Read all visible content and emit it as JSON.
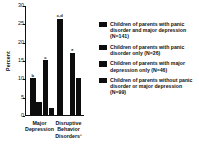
{
  "chart_data": {
    "type": "bar",
    "title": "",
    "xlabel": "",
    "ylabel": "Percent",
    "ylim": [
      0,
      30
    ],
    "yticks": [
      0,
      5,
      10,
      15,
      20,
      25,
      30
    ],
    "ytick_labels": [
      "0",
      "5",
      "10",
      "15",
      "20",
      "25",
      "30"
    ],
    "grid": false,
    "legend_position": "right",
    "categories": [
      "Major Depression",
      "Disruptive Behavior Disorders¹"
    ],
    "series": [
      {
        "name": "Children of parents with panic disorder and major depression (N=141)",
        "values": [
          10.0,
          26.5
        ],
        "annotations": [
          "b",
          "c,d"
        ]
      },
      {
        "name": "Children of parents with panic disorder only (N=26)",
        "values": [
          3.5,
          0.0
        ],
        "annotations": [
          "",
          ""
        ]
      },
      {
        "name": "Children of parents with major depression only (N=46)",
        "values": [
          15.0,
          17.0
        ],
        "annotations": [
          "c",
          "e"
        ]
      },
      {
        "name": "Children of parents without panic disorder or major depression (N=99)",
        "values": [
          1.7,
          10.0
        ],
        "annotations": [
          "",
          ""
        ]
      }
    ]
  },
  "axis": {
    "y_title": "Percent",
    "ticks": [
      "30",
      "25",
      "20",
      "15",
      "10",
      "5",
      "0"
    ]
  },
  "x_axis": {
    "labels": [
      "Major\nDepression",
      "Disruptive\nBehavior\nDisorders¹"
    ],
    "label_0_line_0": "Major",
    "label_0_line_1": "Depression",
    "label_1_line_0": "Disruptive",
    "label_1_line_1": "Behavior",
    "label_1_line_2": "Disorders¹"
  },
  "legend": {
    "items": [
      {
        "label": "Children of parents with panic disorder and major depression (N=141)",
        "color": "#0d0d0d"
      },
      {
        "label": "Children of parents with panic disorder only (N=26)",
        "color": "#0d0d0d"
      },
      {
        "label": "Children of parents with major depression only (N=46)",
        "color": "#0d0d0d"
      },
      {
        "label": "Children of parents without panic disorder or major depression (N=99)",
        "color": "#0d0d0d"
      }
    ]
  },
  "marks": {
    "g0b0": "b",
    "g0b2": "c",
    "g1b0": "c,d",
    "g1b2": "e"
  }
}
